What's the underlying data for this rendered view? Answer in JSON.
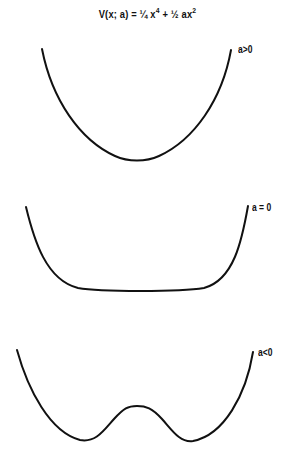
{
  "title": {
    "prefix": "V(x; a)  =  ¼ x",
    "exp1": "4",
    "middle": "  +  ½ ax",
    "exp2": "2"
  },
  "curves": [
    {
      "label": "a>0",
      "shape": "single-well parabola-like"
    },
    {
      "label": "a = 0",
      "shape": "flat-bottomed quartic"
    },
    {
      "label": "a<0",
      "shape": "double-well"
    }
  ]
}
